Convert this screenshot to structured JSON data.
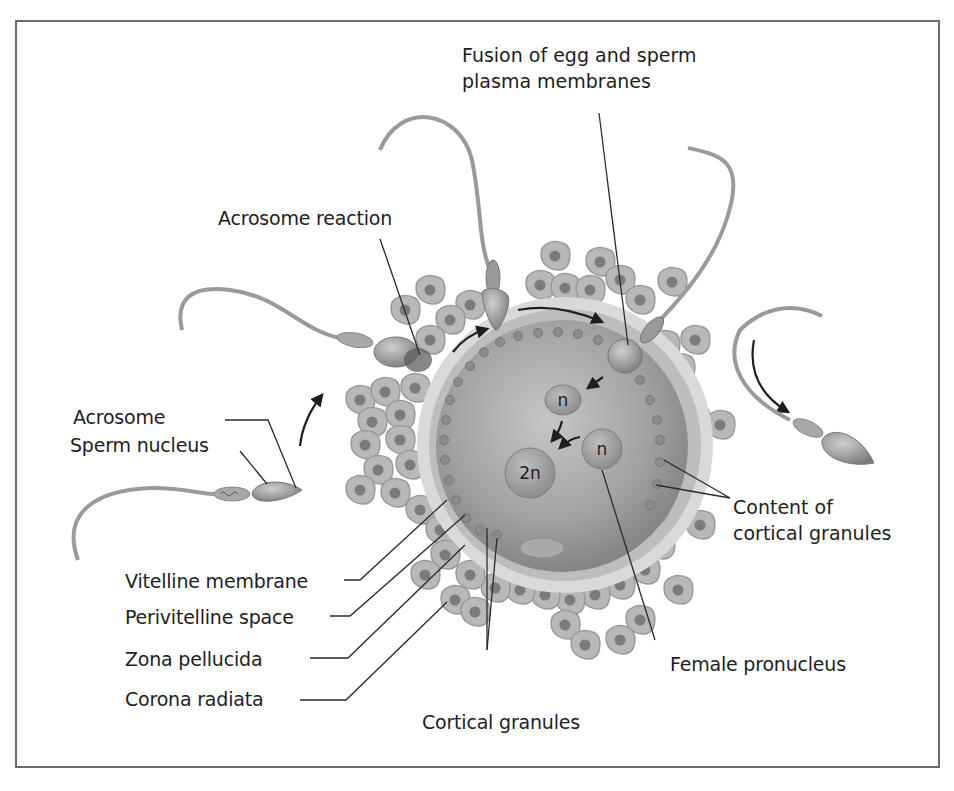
{
  "figure": {
    "labels": {
      "fusion": [
        "Fusion of egg and sperm",
        "plasma membranes"
      ],
      "acrosome_reaction": "Acrosome reaction",
      "acrosome": "Acrosome",
      "sperm_nucleus": "Sperm nucleus",
      "vitelline_membrane": "Vitelline membrane",
      "perivitelline_space": "Perivitelline space",
      "zona_pellucida": "Zona pellucida",
      "corona_radiata": "Corona radiata",
      "cortical_granules": "Cortical granules",
      "female_pronucleus": "Female pronucleus",
      "content_cortical": [
        "Content of",
        "cortical granules"
      ]
    },
    "nuclei": {
      "male": "n",
      "female": "n",
      "zygote": "2n"
    },
    "colors": {
      "background": "#ffffff",
      "frame": "#6b6b6b",
      "egg_cytoplasm": "#9a9a9a",
      "zona": "#c8c8c8",
      "cell_fill": "#b5b5b5",
      "cell_nucleus": "#7a7a7a",
      "text": "#1e1e1e",
      "leader_line": "#2a2a2a"
    }
  }
}
